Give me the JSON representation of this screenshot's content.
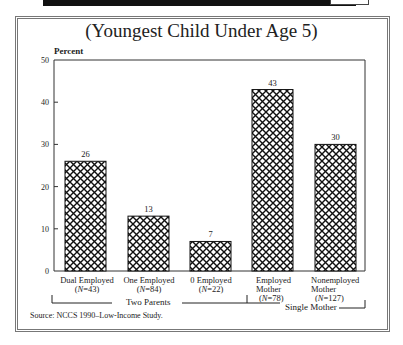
{
  "chart_data": {
    "type": "bar",
    "title": "(Youngest Child Under Age 5)",
    "ylabel": "Percent",
    "xlabel": "",
    "ylim": [
      0,
      50
    ],
    "yticks": [
      0,
      10,
      20,
      30,
      40,
      50
    ],
    "grid": false,
    "pattern": "crosshatch",
    "categories": [
      "Dual Employed",
      "One Employed",
      "0 Employed",
      "Employed Mother",
      "Nonemployed Mother"
    ],
    "sample_sizes": [
      "N=43",
      "N=84",
      "N=22",
      "N=78",
      "N=127"
    ],
    "values": [
      26,
      13,
      7,
      43,
      30
    ],
    "groups": [
      {
        "label": "Two Parents",
        "categories": [
          "Dual Employed",
          "One Employed",
          "0 Employed"
        ]
      },
      {
        "label": "Single Mother",
        "categories": [
          "Employed Mother",
          "Nonemployed Mother"
        ]
      }
    ],
    "source": "Source: NCCS 1990–Low-Income Study."
  },
  "labels": {
    "title": "(Youngest Child Under Age 5)",
    "ylabel": "Percent",
    "yticks": [
      "0",
      "10",
      "20",
      "30",
      "40",
      "50"
    ],
    "values": [
      "26",
      "13",
      "7",
      "43",
      "30"
    ],
    "cats": [
      {
        "line1": "Dual Employed",
        "line2": "",
        "n": "N",
        "nval": "=43"
      },
      {
        "line1": "One Employed",
        "line2": "",
        "n": "N",
        "nval": "=84"
      },
      {
        "line1": "0 Employed",
        "line2": "",
        "n": "N",
        "nval": "=22"
      },
      {
        "line1": "Employed",
        "line2": "Mother",
        "n": "N",
        "nval": "=78"
      },
      {
        "line1": "Nonemployed",
        "line2": "Mother",
        "n": "N",
        "nval": "=127"
      }
    ],
    "group_two_parents": "Two Parents",
    "group_single_mother": "Single Mother",
    "source": "Source: NCCS 1990–Low-Income Study."
  }
}
